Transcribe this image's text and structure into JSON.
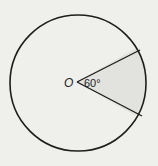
{
  "diagram": {
    "type": "circle-sector",
    "center_label": "O",
    "angle_label": "60°",
    "angle_degrees": 60,
    "colors": {
      "background": "#efefec",
      "stroke": "#1e1e1e",
      "sector_fill": "#e2e2df"
    }
  }
}
